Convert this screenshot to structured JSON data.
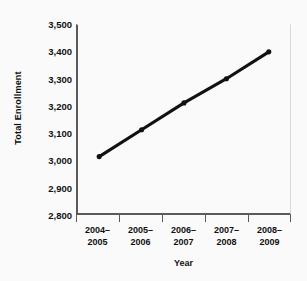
{
  "chart_data": {
    "type": "line",
    "title": "",
    "xlabel": "Year",
    "ylabel": "Total Enrollment",
    "categories": [
      "2004–\n2005",
      "2005–\n2006",
      "2006–\n2007",
      "2007–\n2008",
      "2008–\n2009"
    ],
    "category_lines": [
      [
        "2004–",
        "2005"
      ],
      [
        "2005–",
        "2006"
      ],
      [
        "2006–",
        "2007"
      ],
      [
        "2007–",
        "2008"
      ],
      [
        "2008–",
        "2009"
      ]
    ],
    "values": [
      3010,
      3110,
      3210,
      3300,
      3400
    ],
    "ylim": [
      2800,
      3500
    ],
    "yticks": [
      3500,
      3400,
      3300,
      3200,
      3100,
      3000,
      2900,
      2800
    ],
    "ytick_labels": [
      "3,500",
      "3,400",
      "3,300",
      "3,200",
      "3,100",
      "3,000",
      "2,900",
      "2,800"
    ],
    "grid": false,
    "legend": "none",
    "series_color": "#111111",
    "marker": "circle",
    "background_color": "#fafafa",
    "axis_color": "#5a5a5a"
  }
}
